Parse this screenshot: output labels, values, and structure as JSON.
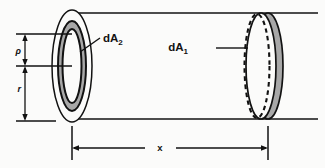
{
  "figure": {
    "kind": "technical-line-diagram",
    "background_color": "#fbfbfa",
    "ink_color": "#121212",
    "shade_color": "#a8a8a8"
  },
  "labels": {
    "dA2": {
      "base": "dA",
      "subscript": "2"
    },
    "dA1": {
      "base": "dA",
      "subscript": "1"
    },
    "rho": "ρ",
    "r": "r",
    "x": "x"
  },
  "annotations": [
    {
      "name": "dA2-leader",
      "from": "label",
      "to": "gray-annulus-on-near-face"
    },
    {
      "name": "dA1-leader",
      "from": "label",
      "to": "dashed-ellipse-on-far-face"
    }
  ],
  "dimensions": [
    {
      "name": "rho",
      "orientation": "vertical",
      "label": "ρ",
      "arrows": "both-ends"
    },
    {
      "name": "r",
      "orientation": "vertical",
      "label": "r",
      "arrows": "both-ends"
    },
    {
      "name": "x",
      "orientation": "horizontal",
      "label": "x",
      "arrows": "both-ends"
    }
  ]
}
